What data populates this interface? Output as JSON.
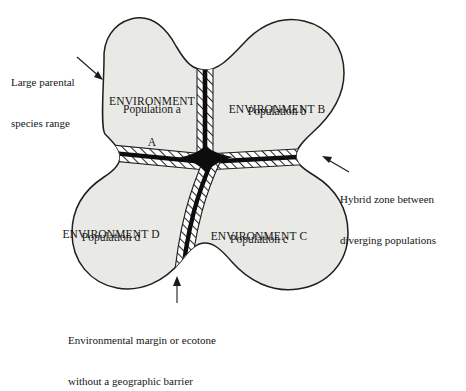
{
  "figure": {
    "background_color": "#ffffff",
    "range_fill_color": "#e9e9e6",
    "range_outline_color": "#1f1f1f",
    "barrier_line_color": "#0d0d0d",
    "hatch_color": "#2b2b2b",
    "text_color": "#151515"
  },
  "quadrants": [
    {
      "id": "environment-a",
      "environment_line1": "ENVIRONMENT",
      "environment_line2": "A",
      "population": "Population a"
    },
    {
      "id": "environment-b",
      "environment_line1": "ENVIRONMENT B",
      "environment_line2": "",
      "population": "Population b"
    },
    {
      "id": "environment-d",
      "environment_line1": "ENVIRONMENT D",
      "environment_line2": "",
      "population": "Population d"
    },
    {
      "id": "environment-c",
      "environment_line1": "ENVIRONMENT C",
      "environment_line2": "",
      "population": "Population c"
    }
  ],
  "callouts": {
    "parental_range": {
      "line1": "Large parental",
      "line2": "species range"
    },
    "hybrid_zone": {
      "line1": "Hybrid zone between",
      "line2": "diverging populations"
    },
    "ecotone": {
      "line1": "Environmental margin or ecotone",
      "line2": "without a geographic barrier"
    }
  }
}
